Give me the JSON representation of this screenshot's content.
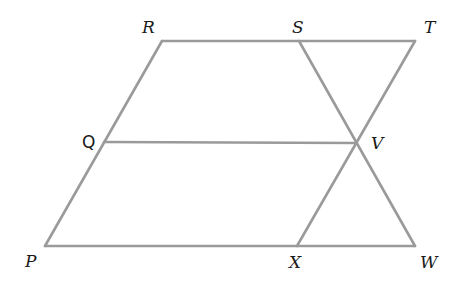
{
  "diagram": {
    "line_color": "#9a9a9a",
    "label_color": "#1a1a1a",
    "points": {
      "R": {
        "label": "R",
        "x": 162,
        "y": 41
      },
      "S": {
        "label": "S",
        "x": 299,
        "y": 41
      },
      "T": {
        "label": "T",
        "x": 415,
        "y": 41
      },
      "Q": {
        "label": "Q",
        "x": 104,
        "y": 142
      },
      "V": {
        "label": "V",
        "x": 356,
        "y": 143
      },
      "P": {
        "label": "P",
        "x": 45,
        "y": 246
      },
      "X": {
        "label": "X",
        "x": 297,
        "y": 246
      },
      "W": {
        "label": "W",
        "x": 415,
        "y": 246
      }
    },
    "segments": [
      [
        "R",
        "T"
      ],
      [
        "P",
        "W"
      ],
      [
        "P",
        "R"
      ],
      [
        "Q",
        "V"
      ],
      [
        "S",
        "W"
      ],
      [
        "T",
        "X"
      ]
    ]
  }
}
